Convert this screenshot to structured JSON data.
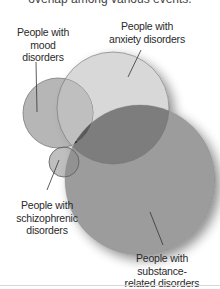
{
  "caption": "overlap among various events.",
  "diagram": {
    "type": "venn",
    "sets": [
      {
        "id": "mood",
        "label": "People with mood disorders",
        "lines": [
          "People with",
          "mood",
          "disorders"
        ],
        "color": "#a8a8a8"
      },
      {
        "id": "anxiety",
        "label": "People with anxiety disorders",
        "lines": [
          "People with",
          "anxiety disorders"
        ],
        "color": "#d6d6d6"
      },
      {
        "id": "substance",
        "label": "People with substance-related disorders",
        "lines": [
          "People with substance-",
          "related disorders"
        ],
        "color": "#9a9a9a"
      },
      {
        "id": "schizophrenic",
        "label": "People with schizophrenic disorders",
        "lines": [
          "People with",
          "schizophrenic",
          "disorders"
        ],
        "color": "#8c8c8c"
      }
    ],
    "intersection_all_color": "#1e1e1e"
  }
}
